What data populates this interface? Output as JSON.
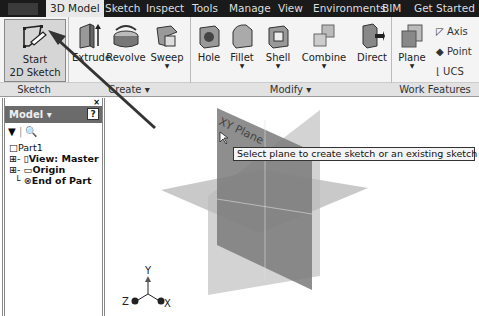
{
  "tabs": [
    "3D Model",
    "Sketch",
    "Inspect",
    "Tools",
    "Manage",
    "View",
    "Environments",
    "BIM",
    "Get Started"
  ],
  "active_tab": "3D Model",
  "ribbon": {
    "sketch_panel": {
      "start_label_1": "Start",
      "start_label_2": "2D Sketch",
      "panel_label": "Sketch"
    },
    "create_panel": {
      "tools": [
        "Extrude",
        "Revolve",
        "Sweep"
      ],
      "panel_label": "Create ▾"
    },
    "modify_panel": {
      "tools": [
        "Hole",
        "Fillet",
        "Shell",
        "Combine",
        "Direct"
      ],
      "panel_label": "Modify ▾"
    },
    "work_features_panel": {
      "tools": [
        "Plane"
      ],
      "small_tools": [
        "Axis",
        "Point",
        "UCS"
      ],
      "panel_label": "Work Features"
    }
  },
  "browser": {
    "title": "Model ▾",
    "help": "?",
    "tree": [
      "Part1",
      "View: Master",
      "Origin",
      "End of Part"
    ]
  },
  "viewport": {
    "plane_label": "XY Plane",
    "tooltip": "Select plane to create sketch or an existing sketch to edit",
    "axes": {
      "x": "X",
      "y": "Y",
      "z": "Z"
    }
  }
}
